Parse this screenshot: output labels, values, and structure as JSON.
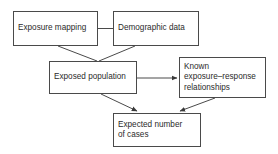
{
  "diagram": {
    "type": "flowchart",
    "title": "",
    "background_color": "#ffffff",
    "border_color": "#4a4a4a",
    "text_color": "#2b2b2b",
    "nodes": [
      {
        "id": "exposure-mapping",
        "label": "Exposure mapping",
        "x": 13,
        "y": 11,
        "w": 85,
        "h": 35
      },
      {
        "id": "demographic-data",
        "label": "Demographic data",
        "x": 113,
        "y": 11,
        "w": 86,
        "h": 35
      },
      {
        "id": "exposed-population",
        "label": "Exposed population",
        "x": 49,
        "y": 61,
        "w": 88,
        "h": 33
      },
      {
        "id": "known-exposure-response-relationships",
        "label": "Known\nexposure–response\nrelationships",
        "x": 179,
        "y": 57,
        "w": 87,
        "h": 41
      },
      {
        "id": "expected-number-of-cases",
        "label": "Expected number\nof cases",
        "x": 113,
        "y": 113,
        "w": 88,
        "h": 34
      }
    ],
    "edges": [
      {
        "id": "exposure-mapping-to-demographic-data",
        "from": "exposure-mapping",
        "to": "demographic-data",
        "style": "line",
        "arrowhead": false
      },
      {
        "id": "exposure-mapping-to-exposed-population",
        "from": "exposure-mapping",
        "to": "exposed-population",
        "style": "line",
        "arrowhead": false
      },
      {
        "id": "demographic-data-to-exposed-population",
        "from": "demographic-data",
        "to": "exposed-population",
        "style": "line",
        "arrowhead": false
      },
      {
        "id": "exposed-population-to-known-exposure-response",
        "from": "exposed-population",
        "to": "known-exposure-response-relationships",
        "style": "arrow",
        "arrowhead": true
      },
      {
        "id": "exposed-population-to-expected-cases",
        "from": "exposed-population",
        "to": "expected-number-of-cases",
        "style": "arrow",
        "arrowhead": true
      },
      {
        "id": "known-exposure-response-to-expected-cases",
        "from": "known-exposure-response-relationships",
        "to": "expected-number-of-cases",
        "style": "arrow",
        "arrowhead": true
      }
    ]
  }
}
